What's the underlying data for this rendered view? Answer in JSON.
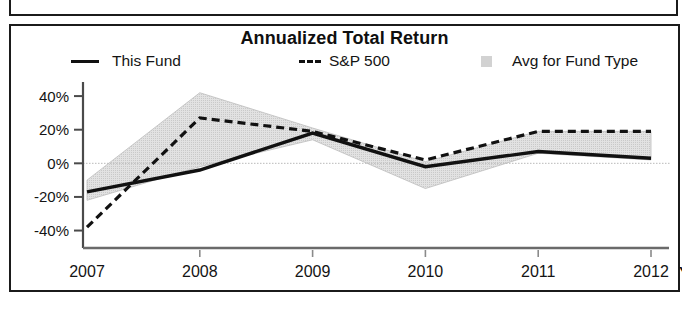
{
  "panel": {
    "title": "Annualized Total Return"
  },
  "legend": {
    "items": [
      {
        "label": "This Fund",
        "marker": "solid-line-swatch",
        "color": "#111111"
      },
      {
        "label": "S&P 500",
        "marker": "dashed-line-swatch",
        "color": "#111111"
      },
      {
        "label": "Avg for Fund Type",
        "marker": "shaded-band-swatch",
        "color": "#d2d2d2"
      }
    ]
  },
  "axis": {
    "x_suffix_label": "YTD"
  },
  "chart_data": {
    "type": "line",
    "title": "Annualized Total Return",
    "xlabel": "",
    "ylabel": "",
    "categories": [
      "2007",
      "2008",
      "2009",
      "2010",
      "2011",
      "2012"
    ],
    "ytick_labels": [
      "40%",
      "20%",
      "0%",
      "-20%",
      "-40%"
    ],
    "ytick_values": [
      40,
      20,
      0,
      -20,
      -40
    ],
    "ylim": [
      -48,
      46
    ],
    "grid": false,
    "zero_line": true,
    "legend_position": "top",
    "series": [
      {
        "name": "This Fund",
        "style": "solid",
        "color": "#111111",
        "values": [
          -17,
          -4,
          18,
          -2,
          7,
          3
        ]
      },
      {
        "name": "S&P 500",
        "style": "dashed",
        "color": "#111111",
        "values": [
          -38,
          27,
          19,
          2,
          19,
          19
        ]
      },
      {
        "name": "Avg for Fund Type",
        "style": "band",
        "color": "#d2d2d2",
        "upper": [
          -10,
          42,
          21,
          1,
          19,
          19
        ],
        "lower": [
          -22,
          -2,
          14,
          -15,
          6,
          2
        ]
      }
    ]
  }
}
